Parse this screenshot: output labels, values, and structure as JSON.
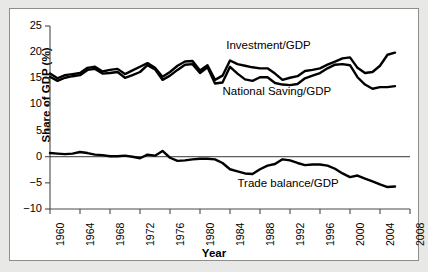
{
  "chart_data": {
    "type": "line",
    "title": "",
    "xlabel": "Year",
    "ylabel": "Share of GDP (%)",
    "xlim": [
      1960,
      2008
    ],
    "ylim": [
      -10,
      25
    ],
    "yticks": [
      -10,
      -5,
      0,
      5,
      10,
      15,
      20,
      25
    ],
    "ytick_labels": [
      "−10",
      "−5",
      "0",
      "5",
      "10",
      "15",
      "20",
      "25"
    ],
    "xticks": [
      1960,
      1964,
      1968,
      1972,
      1976,
      1980,
      1984,
      1988,
      1992,
      1996,
      2000,
      2004,
      2008
    ],
    "xtick_labels": [
      "1960",
      "1964",
      "1968",
      "1972",
      "1976",
      "1980",
      "1984",
      "1988",
      "1992",
      "1996",
      "2000",
      "2004",
      "2008"
    ],
    "grid": false,
    "legend_position": "inline-annotations",
    "zero_line": 0,
    "x": [
      1960,
      1961,
      1962,
      1963,
      1964,
      1965,
      1966,
      1967,
      1968,
      1969,
      1970,
      1971,
      1972,
      1973,
      1974,
      1975,
      1976,
      1977,
      1978,
      1979,
      1980,
      1981,
      1982,
      1983,
      1984,
      1985,
      1986,
      1987,
      1988,
      1989,
      1990,
      1991,
      1992,
      1993,
      1994,
      1995,
      1996,
      1997,
      1998,
      1999,
      2000,
      2001,
      2002,
      2003,
      2004,
      2005,
      2006
    ],
    "series": [
      {
        "name": "Investment/GDP",
        "label": "Investment/GDP",
        "color": "#000000",
        "values": [
          15.9,
          15.0,
          15.6,
          15.8,
          16.0,
          17.0,
          17.2,
          16.3,
          16.6,
          16.8,
          15.8,
          16.5,
          17.2,
          17.9,
          17.0,
          15.3,
          16.2,
          17.4,
          18.2,
          18.3,
          16.5,
          17.5,
          14.7,
          15.5,
          18.4,
          17.7,
          17.4,
          17.1,
          16.9,
          16.9,
          15.9,
          14.7,
          15.1,
          15.4,
          16.4,
          16.6,
          16.9,
          17.6,
          18.2,
          18.8,
          19.0,
          17.0,
          16.0,
          16.2,
          17.4,
          19.5,
          19.9
        ]
      },
      {
        "name": "National Saving/GDP",
        "label": "National Saving/GDP",
        "color": "#000000",
        "values": [
          15.3,
          14.5,
          15.1,
          15.4,
          15.6,
          16.6,
          16.8,
          15.9,
          16.0,
          16.2,
          15.1,
          15.6,
          16.2,
          17.5,
          16.7,
          14.7,
          15.5,
          16.6,
          17.6,
          17.7,
          16.0,
          17.1,
          14.0,
          14.2,
          17.2,
          15.9,
          14.8,
          14.5,
          15.2,
          15.2,
          14.1,
          13.8,
          13.7,
          13.9,
          15.0,
          15.5,
          16.0,
          16.9,
          17.6,
          17.7,
          17.5,
          15.2,
          13.8,
          13.0,
          13.3,
          13.3,
          13.5
        ]
      },
      {
        "name": "Trade balance/GDP",
        "label": "Trade balance/GDP",
        "color": "#000000",
        "values": [
          0.7,
          0.6,
          0.5,
          0.6,
          0.9,
          0.7,
          0.4,
          0.3,
          0.1,
          0.1,
          0.2,
          0.0,
          -0.3,
          0.4,
          0.2,
          1.1,
          -0.2,
          -0.8,
          -0.7,
          -0.5,
          -0.4,
          -0.4,
          -0.5,
          -1.2,
          -2.4,
          -2.8,
          -3.2,
          -3.3,
          -2.4,
          -1.7,
          -1.4,
          -0.5,
          -0.7,
          -1.2,
          -1.6,
          -1.5,
          -1.5,
          -1.7,
          -2.3,
          -3.2,
          -3.9,
          -3.6,
          -4.2,
          -4.7,
          -5.3,
          -5.8,
          -5.7
        ]
      }
    ],
    "annotations": [
      {
        "text": "Investment/GDP",
        "x": 1983.5,
        "y": 21.0
      },
      {
        "text": "National Saving/GDP",
        "x": 1983.0,
        "y": 12.2
      },
      {
        "text": "Trade balance/GDP",
        "x": 1985.0,
        "y": -5.4
      }
    ]
  }
}
